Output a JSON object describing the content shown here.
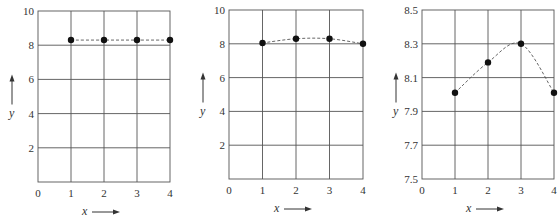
{
  "chart_data": [
    {
      "type": "scatter",
      "title": "",
      "xlabel": "x",
      "ylabel": "y",
      "x": [
        1,
        2,
        3,
        4
      ],
      "series": [
        {
          "name": "points",
          "values": [
            8.3,
            8.3,
            8.3,
            8.3
          ]
        }
      ],
      "xlim": [
        0,
        4
      ],
      "ylim": [
        0,
        10
      ],
      "xticks": [
        "0",
        "1",
        "2",
        "3",
        "4"
      ],
      "yticks": [
        "2",
        "4",
        "6",
        "8",
        "10"
      ],
      "grid": true,
      "connector": "dashed"
    },
    {
      "type": "scatter",
      "title": "",
      "xlabel": "x",
      "ylabel": "y",
      "x": [
        1,
        2,
        3,
        4
      ],
      "series": [
        {
          "name": "points",
          "values": [
            8.05,
            8.3,
            8.3,
            8.0
          ]
        }
      ],
      "xlim": [
        0,
        4
      ],
      "ylim": [
        0,
        10
      ],
      "xticks": [
        "0",
        "1",
        "2",
        "3",
        "4"
      ],
      "yticks": [
        "2",
        "4",
        "6",
        "8",
        "10"
      ],
      "grid": true,
      "connector": "dashed"
    },
    {
      "type": "scatter",
      "title": "",
      "xlabel": "x",
      "ylabel": "y",
      "x": [
        1,
        2,
        3,
        4
      ],
      "series": [
        {
          "name": "points",
          "values": [
            8.01,
            8.19,
            8.3,
            8.01
          ]
        }
      ],
      "xlim": [
        0,
        4
      ],
      "ylim": [
        7.5,
        8.5
      ],
      "xticks": [
        "0",
        "1",
        "2",
        "3",
        "4"
      ],
      "yticks": [
        "7.5",
        "7.7",
        "7.9",
        "8.1",
        "8.3",
        "8.5"
      ],
      "grid": true,
      "connector": "dashed"
    }
  ],
  "labels": {
    "x": "x",
    "y": "y"
  }
}
